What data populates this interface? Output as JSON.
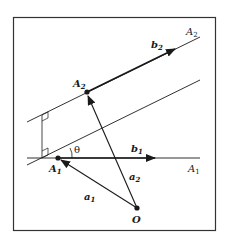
{
  "diagram": {
    "frame": {
      "x": 13,
      "y": 17,
      "width": 203,
      "height": 214
    },
    "colors": {
      "stroke": "#1a1a1a",
      "background": "#ffffff"
    },
    "lines": {
      "A1": {
        "label": "A",
        "sub": "1",
        "x1": 27,
        "y1": 158,
        "x2": 200,
        "y2": 158
      },
      "A2": {
        "label": "A",
        "sub": "2",
        "x1": 27,
        "y1": 122,
        "x2": 200,
        "y2": 37
      },
      "parallel": {
        "x1": 27,
        "y1": 165,
        "x2": 200,
        "y2": 80
      },
      "perpendicular": {
        "x1": 42,
        "y1": 115,
        "x2": 42,
        "y2": 158
      }
    },
    "points": {
      "A1": {
        "label": "A",
        "sub": "1",
        "x": 58,
        "y": 158
      },
      "A2": {
        "label": "A",
        "sub": "2",
        "x": 87,
        "y": 92
      },
      "O": {
        "label": "O",
        "x": 137,
        "y": 208
      }
    },
    "vectors": {
      "b1": {
        "label": "b",
        "sub": "1"
      },
      "b2": {
        "label": "b",
        "sub": "2"
      },
      "a1": {
        "label": "a",
        "sub": "1"
      },
      "a2": {
        "label": "a",
        "sub": "2"
      }
    },
    "angle": {
      "label": "θ"
    }
  }
}
